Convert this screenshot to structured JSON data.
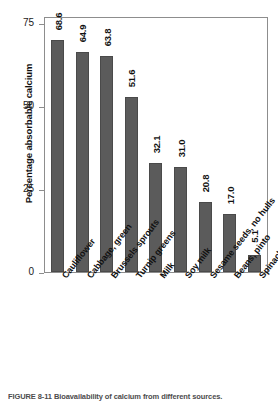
{
  "chart_data": {
    "type": "bar",
    "title": "",
    "xlabel": "",
    "ylabel": "Percentage absorbable calcium",
    "ylim": [
      0,
      75
    ],
    "yticks": [
      0,
      25,
      50,
      75
    ],
    "ytick_labels": [
      "0",
      "25",
      "50",
      "75"
    ],
    "grid": false,
    "legend": "none",
    "orientation": "vertical",
    "bar_color": "#5b5b5b",
    "value_label_position": "above-bar-rotated",
    "categories": [
      "Cauliflower",
      "Cabbage, green",
      "Brussels sprouts",
      "Turnip greens",
      "Milk",
      "Soy milk",
      "Sesame seeds, no hulls",
      "Beans, pinto",
      "Spinach"
    ],
    "values": [
      68.6,
      64.9,
      63.8,
      51.6,
      32.1,
      31.0,
      20.8,
      17.0,
      5.1
    ],
    "value_labels": [
      "68.6",
      "64.9",
      "63.8",
      "51.6",
      "32.1",
      "31.0",
      "20.8",
      "17.0",
      "5.1"
    ]
  },
  "caption": {
    "text": "FIGURE 8-11  Bioavailability of calcium from different sources."
  }
}
